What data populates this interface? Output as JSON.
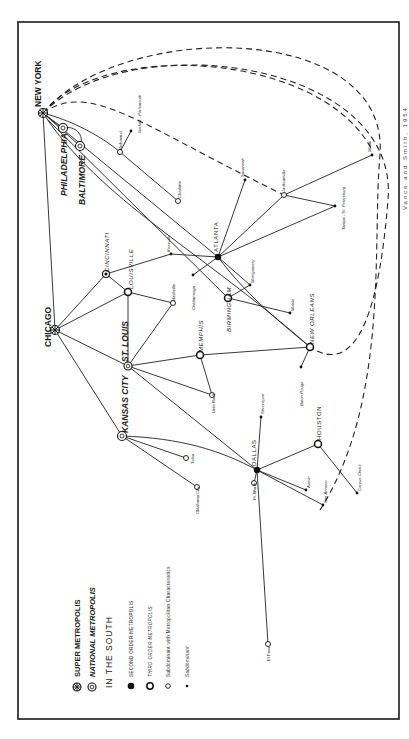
{
  "figure": {
    "caption_fragment": "Vance and Smith, 1954",
    "orientation": "rotated 90° counter-clockwise (text reads bottom-to-top)"
  },
  "legend": {
    "items": [
      {
        "symbol": "super-metropolis-icon",
        "label": "SUPER METROPOLIS"
      },
      {
        "symbol": "national-metropolis-icon",
        "label": "NATIONAL METROPOLIS"
      },
      {
        "symbol": "none",
        "label": "IN THE SOUTH"
      },
      {
        "symbol": "second-order-icon",
        "label": "SECOND ORDER METROPOLIS"
      },
      {
        "symbol": "third-order-icon",
        "label": "THIRD ORDER METROPOLIS"
      },
      {
        "symbol": "subdominant-metro-icon",
        "label": "Subdominant with Metropolitan Characteristics"
      },
      {
        "symbol": "subdominant-icon",
        "label": "Subdominant"
      }
    ]
  },
  "cities": {
    "new_york": "NEW YORK",
    "philadelphia": "PHILADELPHIA",
    "baltimore": "BALTIMORE",
    "richmond": "Richmond",
    "norfolk": "Norfolk - Portsmouth",
    "charlotte": "Charlotte",
    "chicago": "CHICAGO",
    "cincinnati": "CINCINNATI",
    "louisville": "LOUISVILLE",
    "knoxville": "Knoxville",
    "nashville": "Nashville",
    "atlanta": "ATLANTA",
    "chattanooga": "Chattanooga",
    "savannah": "Savannah",
    "jacksonville": "Jacksonville",
    "miami": "Miami",
    "tampa": "Tampa - St. Petersburg",
    "montgomery": "Montgomery",
    "birmingham": "BIRMINGHAM",
    "mobile": "Mobile",
    "new_orleans": "NEW ORLEANS",
    "baton_rouge": "Baton Rouge",
    "st_louis": "ST. LOUIS",
    "memphis": "MEMPHIS",
    "little_rock": "Little Rock",
    "shreveport": "Shreveport",
    "kansas_city": "KANSAS CITY",
    "tulsa": "Tulsa",
    "oklahoma_city": "Oklahoma City",
    "dallas": "DALLAS",
    "ft_worth": "Ft. Worth",
    "austin": "Austin",
    "san_antonio": "San Antonio",
    "houston": "HOUSTON",
    "corpus_christi": "Corpus Christi",
    "el_paso": "El Paso"
  },
  "hierarchy": {
    "super_metropolis": [
      "NEW YORK",
      "CHICAGO"
    ],
    "national_metropolis": [
      "PHILADELPHIA",
      "BALTIMORE",
      "ST. LOUIS",
      "KANSAS CITY",
      "CINCINNATI"
    ],
    "second_order": [
      "ATLANTA",
      "DALLAS"
    ],
    "third_order": [
      "LOUISVILLE",
      "MEMPHIS",
      "BIRMINGHAM",
      "NEW ORLEANS",
      "HOUSTON"
    ],
    "subdominant_metro": [
      "Richmond",
      "Charlotte",
      "Nashville",
      "Jacksonville",
      "Little Rock",
      "Tulsa",
      "Oklahoma City",
      "Ft. Worth",
      "El Paso"
    ],
    "subdominant": [
      "Norfolk - Portsmouth",
      "Knoxville",
      "Chattanooga",
      "Savannah",
      "Miami",
      "Tampa - St. Petersburg",
      "Montgomery",
      "Mobile",
      "Baton Rouge",
      "Shreveport",
      "Austin",
      "San Antonio",
      "Corpus Christi"
    ]
  },
  "links": {
    "solid": [
      [
        "NEW YORK",
        "PHILADELPHIA"
      ],
      [
        "NEW YORK",
        "BALTIMORE"
      ],
      [
        "NEW YORK",
        "Richmond"
      ],
      [
        "NEW YORK",
        "CHICAGO"
      ],
      [
        "NEW YORK",
        "ATLANTA"
      ],
      [
        "NEW YORK",
        "BIRMINGHAM"
      ],
      [
        "NEW YORK",
        "NEW ORLEANS"
      ],
      [
        "Richmond",
        "Norfolk - Portsmouth"
      ],
      [
        "Richmond",
        "Charlotte"
      ],
      [
        "CHICAGO",
        "CINCINNATI"
      ],
      [
        "CHICAGO",
        "LOUISVILLE"
      ],
      [
        "CHICAGO",
        "ST. LOUIS"
      ],
      [
        "CHICAGO",
        "KANSAS CITY"
      ],
      [
        "CINCINNATI",
        "LOUISVILLE"
      ],
      [
        "CINCINNATI",
        "Knoxville"
      ],
      [
        "Knoxville",
        "ATLANTA"
      ],
      [
        "LOUISVILLE",
        "Nashville"
      ],
      [
        "LOUISVILLE",
        "ST. LOUIS"
      ],
      [
        "Nashville",
        "ST. LOUIS"
      ],
      [
        "ATLANTA",
        "Chattanooga"
      ],
      [
        "ATLANTA",
        "Savannah"
      ],
      [
        "ATLANTA",
        "Jacksonville"
      ],
      [
        "ATLANTA",
        "Tampa - St. Petersburg"
      ],
      [
        "ATLANTA",
        "Montgomery"
      ],
      [
        "ATLANTA",
        "NEW ORLEANS"
      ],
      [
        "Jacksonville",
        "Miami"
      ],
      [
        "Jacksonville",
        "Tampa - St. Petersburg"
      ],
      [
        "Montgomery",
        "BIRMINGHAM"
      ],
      [
        "BIRMINGHAM",
        "Mobile"
      ],
      [
        "ST. LOUIS",
        "MEMPHIS"
      ],
      [
        "ST. LOUIS",
        "Little Rock"
      ],
      [
        "ST. LOUIS",
        "DALLAS"
      ],
      [
        "MEMPHIS",
        "NEW ORLEANS"
      ],
      [
        "MEMPHIS",
        "Little Rock"
      ],
      [
        "NEW ORLEANS",
        "Baton Rouge"
      ],
      [
        "KANSAS CITY",
        "Tulsa"
      ],
      [
        "KANSAS CITY",
        "Oklahoma City"
      ],
      [
        "KANSAS CITY",
        "DALLAS"
      ],
      [
        "DALLAS",
        "Shreveport"
      ],
      [
        "DALLAS",
        "Ft. Worth"
      ],
      [
        "DALLAS",
        "Austin"
      ],
      [
        "DALLAS",
        "San Antonio"
      ],
      [
        "DALLAS",
        "HOUSTON"
      ],
      [
        "DALLAS",
        "El Paso"
      ],
      [
        "HOUSTON",
        "Corpus Christi"
      ]
    ],
    "dashed": [
      [
        "NEW YORK",
        "Jacksonville"
      ],
      [
        "NEW YORK",
        "Miami"
      ],
      [
        "NEW YORK",
        "NEW ORLEANS"
      ],
      [
        "NEW YORK",
        "HOUSTON"
      ]
    ]
  }
}
